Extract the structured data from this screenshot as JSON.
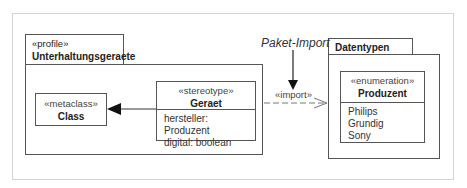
{
  "diagram": {
    "profile_package": {
      "stereotype": "«profile»",
      "name": "Unterhaltungsgeraete",
      "metaclass": {
        "stereotype": "«metaclass»",
        "name": "Class"
      },
      "stereotype_class": {
        "stereotype": "«stereotype»",
        "name": "Geraet",
        "attributes": [
          "hersteller:  Produzent",
          "digital:  boolean"
        ]
      }
    },
    "datatypes_package": {
      "name": "Datentypen",
      "enumeration": {
        "stereotype": "«enumeration»",
        "name": "Produzent",
        "literals": [
          "Philips",
          "Grundig",
          "Sony"
        ]
      }
    },
    "import_relation": {
      "label": "«import»",
      "annotation": "Paket-Import"
    },
    "extension_relation": {
      "from": "Geraet",
      "to": "Class"
    }
  }
}
